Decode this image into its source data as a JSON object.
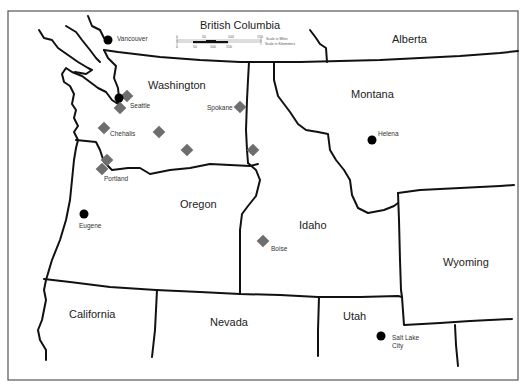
{
  "map": {
    "states": [
      {
        "name": "British Columbia",
        "x": 200,
        "y": 19
      },
      {
        "name": "Alberta",
        "x": 392,
        "y": 33
      },
      {
        "name": "Washington",
        "x": 148,
        "y": 79
      },
      {
        "name": "Montana",
        "x": 351,
        "y": 88
      },
      {
        "name": "Oregon",
        "x": 180,
        "y": 198
      },
      {
        "name": "Idaho",
        "x": 299,
        "y": 219
      },
      {
        "name": "Wyoming",
        "x": 443,
        "y": 256
      },
      {
        "name": "California",
        "x": 69,
        "y": 308
      },
      {
        "name": "Nevada",
        "x": 210,
        "y": 316
      },
      {
        "name": "Utah",
        "x": 343,
        "y": 310
      }
    ],
    "cities": [
      {
        "name": "Vancouver",
        "type": "dot",
        "x": 108,
        "y": 40,
        "label_x": 117,
        "label_y": 35
      },
      {
        "name": "Seattle",
        "type": "dot",
        "x": 119,
        "y": 98,
        "label_x": 130,
        "label_y": 102
      },
      {
        "name": "Spokane",
        "label_x": 207,
        "label_y": 104
      },
      {
        "name": "Chehalis",
        "label_x": 110,
        "label_y": 130
      },
      {
        "name": "Portland",
        "label_x": 104,
        "label_y": 175
      },
      {
        "name": "Eugene",
        "type": "dot",
        "x": 84,
        "y": 214,
        "label_x": 79,
        "label_y": 222
      },
      {
        "name": "Helena",
        "type": "dot",
        "x": 372,
        "y": 140,
        "label_x": 378,
        "label_y": 130
      },
      {
        "name": "Boise",
        "label_x": 271,
        "label_y": 245
      },
      {
        "name": "Salt Lake\nCity",
        "type": "dot",
        "x": 381,
        "y": 336,
        "label_x": 392,
        "label_y": 334
      }
    ],
    "markers": [
      {
        "x": 127,
        "y": 96
      },
      {
        "x": 120,
        "y": 108
      },
      {
        "x": 240,
        "y": 107
      },
      {
        "x": 104,
        "y": 128
      },
      {
        "x": 159,
        "y": 132
      },
      {
        "x": 187,
        "y": 150
      },
      {
        "x": 253,
        "y": 150
      },
      {
        "x": 107,
        "y": 160
      },
      {
        "x": 102,
        "y": 169
      },
      {
        "x": 263,
        "y": 241
      }
    ],
    "scale": {
      "miles_ticks": [
        "0",
        "50",
        "100",
        "150"
      ],
      "km_ticks": [
        "0",
        "50",
        "100",
        "150"
      ],
      "miles_label": "Scale in Miles",
      "km_label": "Scale in Kilometers"
    },
    "colors": {
      "border": "#111111",
      "marker": "#6e6e6e",
      "city_dot": "#000000",
      "frame": "#555555"
    }
  }
}
